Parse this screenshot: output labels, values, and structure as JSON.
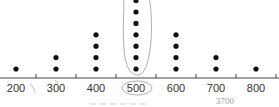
{
  "chart_data": {
    "type": "scatter",
    "subtype": "dot-plot",
    "title": "",
    "xlabel": "",
    "ylabel": "",
    "categories": [
      "200",
      "300",
      "400",
      "500",
      "600",
      "700",
      "800"
    ],
    "values": [
      1,
      2,
      4,
      7,
      4,
      2,
      1
    ],
    "x": [
      200,
      300,
      400,
      500,
      600,
      700,
      800
    ],
    "xlim": [
      150,
      850
    ],
    "grid": false,
    "legend": "none",
    "annotations": {
      "circled_column": "500",
      "circled_label": "500",
      "handwritten_note": "3700"
    }
  },
  "colors": {
    "dot": "#111111",
    "axis": "#444444",
    "annotation": "#9a9a9a"
  }
}
